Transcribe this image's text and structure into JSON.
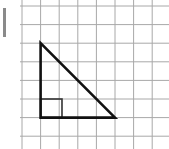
{
  "figure": {
    "grid": {
      "origin_x": 22,
      "origin_y": 6,
      "cell": 18.6,
      "cols": 8,
      "rows": 8,
      "line_color": "#a8a8a8",
      "width": 169,
      "height": 149
    },
    "triangle": {
      "vertices_cells": [
        [
          1,
          2
        ],
        [
          1,
          6
        ],
        [
          5,
          6
        ]
      ],
      "right_angle_vertex": [
        1,
        6
      ],
      "stroke_color": "#111111",
      "stroke_width": 2.6
    },
    "right_angle_marker": {
      "x_cells": 1,
      "y_cells": 5,
      "size_cells": 1,
      "stroke_color": "#333333"
    },
    "left_bar": {
      "color": "#8a8a8a"
    }
  }
}
